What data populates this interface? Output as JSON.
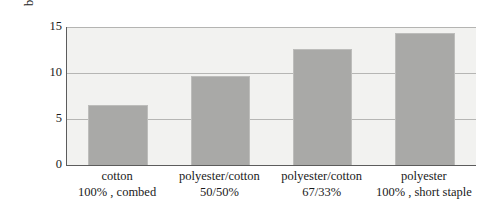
{
  "chart_data": {
    "type": "bar",
    "title": "",
    "subtitle": "",
    "xlabel": "",
    "ylabel": "breaking strain/%",
    "ylim": [
      0,
      15
    ],
    "ytick_labels": [
      "15",
      "10",
      "5",
      "0"
    ],
    "ytick_values": [
      15,
      10,
      5,
      0
    ],
    "grid": true,
    "legend": "none",
    "categories": [
      "cotton 100%, combed",
      "polyester/cotton 50/50%",
      "polyester/cotton 67/33%",
      "polyester 100%, short staple"
    ],
    "category_lines": [
      [
        "cotton",
        "100% , combed"
      ],
      [
        "polyester/cotton",
        "50/50%"
      ],
      [
        "polyester/cotton",
        "67/33%"
      ],
      [
        "polyester",
        "100% , short staple"
      ]
    ],
    "values": [
      6.5,
      9.7,
      12.6,
      14.4
    ],
    "bar_color": "#a9a9a7",
    "plot_background": "#f2f2f0",
    "axis_color": "#5c5c5c",
    "gridline_color": "#b6b6b4"
  }
}
